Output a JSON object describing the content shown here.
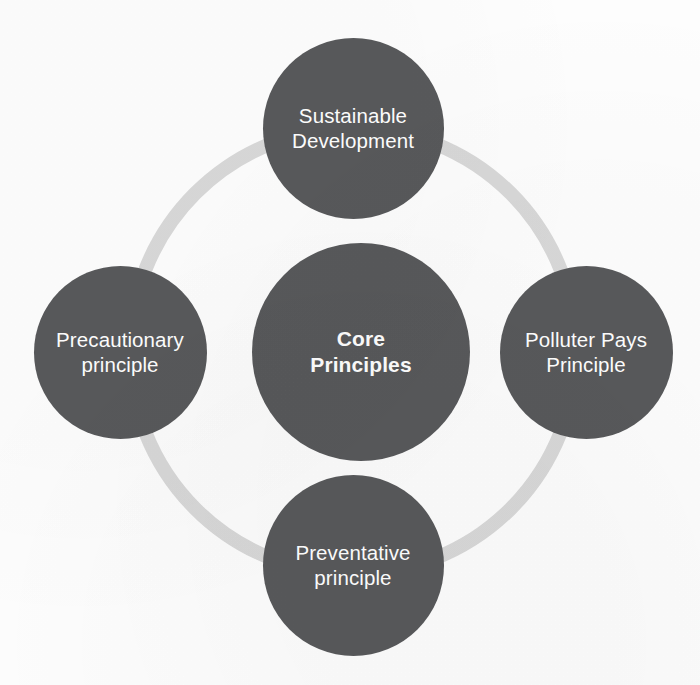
{
  "diagram": {
    "type": "hub-and-spoke cycle diagram",
    "title": "Core Principles",
    "background_color": "#fdfdfd",
    "node_fill_color": "#58595b",
    "node_text_color": "#ffffff",
    "ring_color": "#d8d8d8",
    "center": {
      "id": "core-principles",
      "label": "Core\nPrinciples",
      "bold": true,
      "cx": 361,
      "cy": 352,
      "diameter": 218
    },
    "ring": {
      "cx": 353,
      "cy": 351,
      "diameter": 460,
      "thickness": 14
    },
    "satellites": [
      {
        "id": "sustainable-development",
        "label": "Sustainable\nDevelopment",
        "position": "top",
        "cx": 353,
        "cy": 128,
        "diameter": 181
      },
      {
        "id": "polluter-pays-principle",
        "label": "Polluter Pays\nPrinciple",
        "position": "right",
        "cx": 586,
        "cy": 352,
        "diameter": 173
      },
      {
        "id": "preventative-principle",
        "label": "Preventative\nprinciple",
        "position": "bottom",
        "cx": 353,
        "cy": 565,
        "diameter": 181
      },
      {
        "id": "precautionary-principle",
        "label": "Precautionary\nprinciple",
        "position": "left",
        "cx": 120,
        "cy": 352,
        "diameter": 173
      }
    ]
  }
}
